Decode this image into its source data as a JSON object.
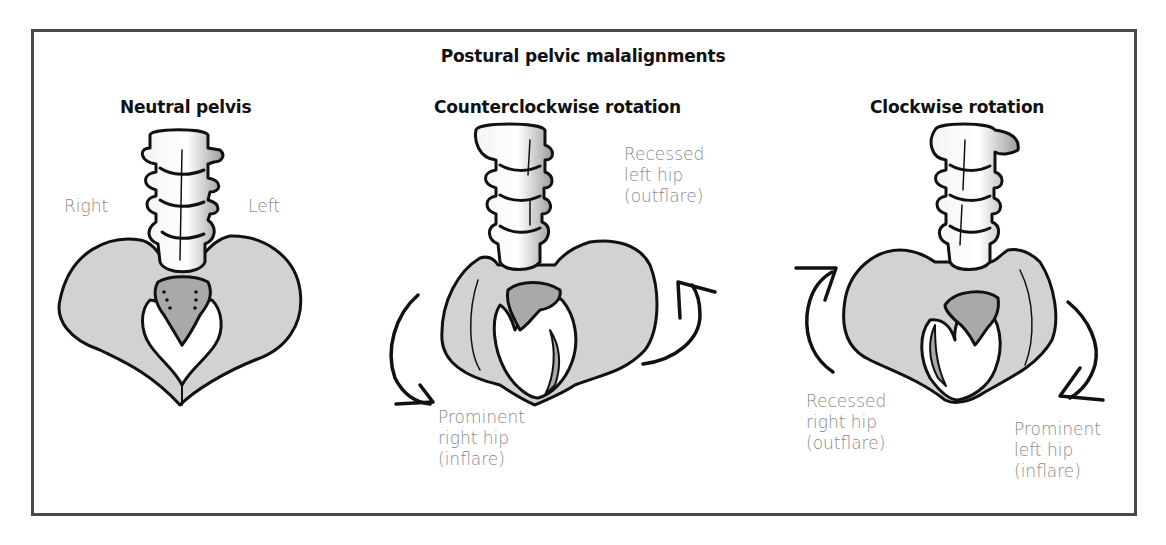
{
  "figure": {
    "title": "Postural pelvic malalignments",
    "colors": {
      "bone_fill": "#d2d2d2",
      "sacrum_fill": "#a9a9a9",
      "vertebra_fill": "#ececec",
      "outline": "#111111",
      "label_text": "#8a8a8a",
      "frame": "#4a4a4a"
    },
    "panels": [
      {
        "title": "Neutral pelvis",
        "labels": {
          "right": "Right",
          "left": "Left"
        }
      },
      {
        "title": "Counterclockwise rotation",
        "labels": {
          "recessed": "Recessed\nleft hip\n(outflare)",
          "prominent": "Prominent\nright hip\n(inflare)"
        },
        "arrows": [
          "counterclockwise-left-down-arrow",
          "counterclockwise-right-up-arrow"
        ]
      },
      {
        "title": "Clockwise rotation",
        "labels": {
          "recessed": "Recessed\nright hip\n(outflare)",
          "prominent": "Prominent\nleft hip\n(inflare)"
        },
        "arrows": [
          "clockwise-left-up-arrow",
          "clockwise-right-down-arrow"
        ]
      }
    ]
  }
}
